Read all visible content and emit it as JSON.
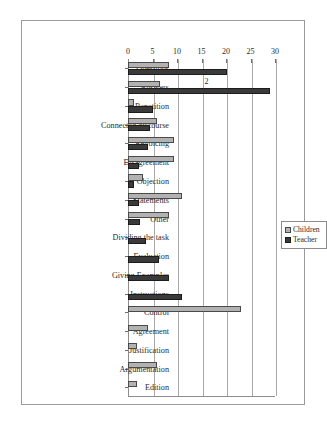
{
  "chart_data": {
    "type": "bar",
    "orientation": "horizontal",
    "title": "",
    "xlabel": "",
    "ylabel": "",
    "xlim": [
      0,
      30
    ],
    "xticks": [
      0,
      5,
      10,
      15,
      20,
      25,
      30
    ],
    "grid": true,
    "legend_position": "right",
    "categories": [
      "Questions",
      "Answers",
      "Repetition",
      "Connected discourse",
      "Revoicing",
      "Disagreement",
      "Objection",
      "Statements",
      "Other",
      "Dividing the task",
      "Evaluation",
      "Giving Examples",
      "Instructions",
      "Control",
      "Agreement",
      "Justification",
      "Argumentation",
      "Edition"
    ],
    "series": [
      {
        "name": "Children",
        "color": "#b2b2b2",
        "values": [
          8.3,
          6.5,
          1.3,
          6.0,
          9.3,
          9.3,
          3.0,
          11.0,
          8.3,
          0,
          0,
          0,
          0,
          23.0,
          4.0,
          1.8,
          6.0,
          1.8
        ]
      },
      {
        "name": "Teacher",
        "color": "#3a3a3a",
        "values": [
          20.3,
          29.0,
          5.0,
          4.5,
          4.0,
          2.3,
          1.3,
          2.3,
          2.5,
          3.7,
          6.3,
          8.3,
          11.0,
          0,
          0,
          0,
          0,
          0
        ]
      }
    ],
    "annotations": [
      {
        "text": "2",
        "x": 15.6,
        "category": "Answers"
      }
    ]
  },
  "legend": {
    "items": [
      {
        "label": "Children"
      },
      {
        "label": "Teacher"
      }
    ]
  }
}
